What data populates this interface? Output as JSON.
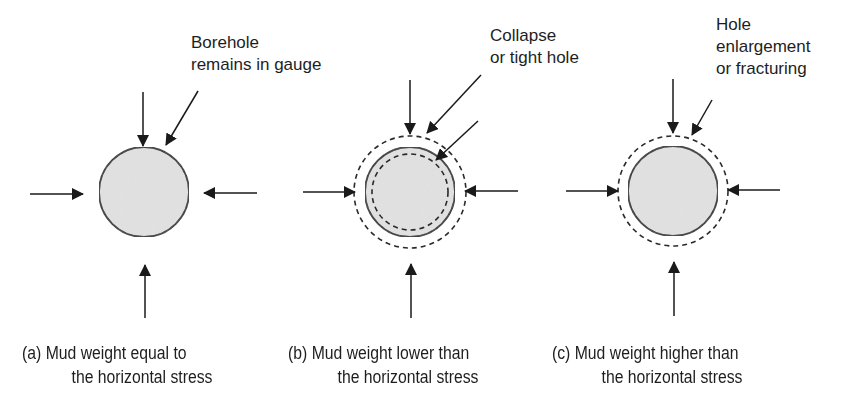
{
  "figure": {
    "type": "borehole stability schematic",
    "colors": {
      "line": "#1a1a1a",
      "fill": "#e4e4e4",
      "background": "#ffffff"
    },
    "panels": [
      {
        "id": "a",
        "callout": {
          "line1": "Borehole",
          "line2": "remains in gauge"
        },
        "caption": {
          "line1": "(a) Mud weight equal to",
          "line2": "the horizontal stress"
        },
        "borehole": {
          "solid_circle": true,
          "outer_dashed_circle": false,
          "inner_dashed_circle": false
        },
        "stress_arrows": [
          "top",
          "bottom",
          "left",
          "right"
        ]
      },
      {
        "id": "b",
        "callout": {
          "line1": "Collapse",
          "line2": "or tight hole"
        },
        "caption": {
          "line1": "(b) Mud weight lower than",
          "line2": "the horizontal stress"
        },
        "borehole": {
          "solid_circle": true,
          "outer_dashed_circle": true,
          "inner_dashed_circle": true
        },
        "stress_arrows": [
          "top",
          "bottom",
          "left",
          "right"
        ]
      },
      {
        "id": "c",
        "callout": {
          "line1": "Hole",
          "line2": "enlargement",
          "line3": "or fracturing"
        },
        "caption": {
          "line1": "(c) Mud weight higher than",
          "line2": "the horizontal stress"
        },
        "borehole": {
          "solid_circle": true,
          "outer_dashed_circle": true,
          "inner_dashed_circle": false
        },
        "stress_arrows": [
          "top",
          "bottom",
          "left",
          "right"
        ]
      }
    ]
  }
}
